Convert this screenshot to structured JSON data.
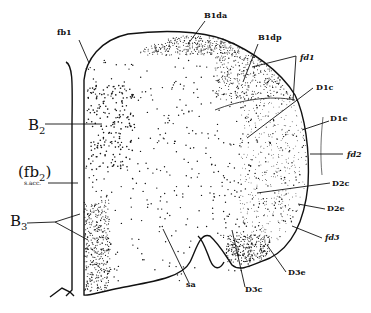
{
  "figure": {
    "type": "anatomical line drawing"
  },
  "labels": [
    {
      "id": "fb1",
      "text": "fb1",
      "x": 57,
      "y": 35,
      "style": "sm"
    },
    {
      "id": "B1da",
      "text": "B1da",
      "x": 204,
      "y": 18,
      "style": "sm"
    },
    {
      "id": "B1dp",
      "text": "B1dp",
      "x": 258,
      "y": 40,
      "style": "sm"
    },
    {
      "id": "fd1",
      "text": "fd1",
      "x": 300,
      "y": 60,
      "style": "sm-it"
    },
    {
      "id": "D1c",
      "text": "D1c",
      "x": 316,
      "y": 90,
      "style": "sm"
    },
    {
      "id": "D1e",
      "text": "D1e",
      "x": 330,
      "y": 121,
      "style": "sm"
    },
    {
      "id": "fd2",
      "text": "fd2",
      "x": 347,
      "y": 157,
      "style": "sm-it"
    },
    {
      "id": "B2",
      "text": "B2",
      "x": 28,
      "y": 130,
      "style": "big"
    },
    {
      "id": "fb2",
      "text": "(fb2)",
      "x": 18,
      "y": 177,
      "style": "big-paren"
    },
    {
      "id": "sacc",
      "text": "s.acc.",
      "x": 24,
      "y": 185,
      "style": "tiny"
    },
    {
      "id": "B3",
      "text": "B3",
      "x": 10,
      "y": 226,
      "style": "big"
    },
    {
      "id": "D2c",
      "text": "D2c",
      "x": 332,
      "y": 186,
      "style": "sm"
    },
    {
      "id": "D2e",
      "text": "D2e",
      "x": 327,
      "y": 211,
      "style": "sm"
    },
    {
      "id": "fd3",
      "text": "fd3",
      "x": 325,
      "y": 240,
      "style": "sm-it"
    },
    {
      "id": "D3e",
      "text": "D3e",
      "x": 288,
      "y": 275,
      "style": "sm"
    },
    {
      "id": "sa",
      "text": "sa",
      "x": 186,
      "y": 287,
      "style": "sm"
    },
    {
      "id": "D3c",
      "text": "D3c",
      "x": 245,
      "y": 292,
      "style": "sm"
    }
  ],
  "leaders": [
    {
      "for": "fb1",
      "points": [
        [
          79,
          40
        ],
        [
          89,
          63
        ]
      ]
    },
    {
      "for": "B1da",
      "points": [
        [
          205,
          21
        ],
        [
          188,
          44
        ]
      ]
    },
    {
      "for": "B1dp",
      "points": [
        [
          258,
          44
        ],
        [
          243,
          82
        ]
      ]
    },
    {
      "for": "fd1-a",
      "points": [
        [
          296,
          56
        ],
        [
          252,
          67
        ]
      ]
    },
    {
      "for": "fd1-b",
      "points": [
        [
          296,
          56
        ],
        [
          293,
          101
        ]
      ]
    },
    {
      "for": "D1c",
      "points": [
        [
          313,
          88
        ],
        [
          247,
          138
        ]
      ]
    },
    {
      "for": "D1e",
      "points": [
        [
          329,
          121
        ],
        [
          302,
          130
        ]
      ]
    },
    {
      "for": "fd2",
      "points": [
        [
          343,
          154
        ],
        [
          310,
          154
        ]
      ]
    },
    {
      "for": "B2",
      "points": [
        [
          45,
          124
        ],
        [
          102,
          124
        ]
      ]
    },
    {
      "for": "sacc",
      "points": [
        [
          48,
          183
        ],
        [
          78,
          183
        ]
      ]
    },
    {
      "for": "B3-a",
      "points": [
        [
          27,
          223
        ],
        [
          55,
          222
        ],
        [
          80,
          214
        ]
      ]
    },
    {
      "for": "B3-b",
      "points": [
        [
          55,
          222
        ],
        [
          88,
          240
        ]
      ]
    },
    {
      "for": "D2c",
      "points": [
        [
          330,
          183
        ],
        [
          257,
          193
        ]
      ]
    },
    {
      "for": "D2e",
      "points": [
        [
          325,
          209
        ],
        [
          298,
          204
        ]
      ]
    },
    {
      "for": "fd3",
      "points": [
        [
          322,
          238
        ],
        [
          292,
          226
        ]
      ]
    },
    {
      "for": "D3e",
      "points": [
        [
          286,
          272
        ],
        [
          267,
          245
        ]
      ]
    },
    {
      "for": "sa",
      "points": [
        [
          189,
          283
        ],
        [
          163,
          229
        ]
      ]
    },
    {
      "for": "D3c",
      "points": [
        [
          245,
          287
        ],
        [
          232,
          230
        ]
      ]
    }
  ],
  "colors": {
    "ink": "#111111",
    "background": "#ffffff"
  }
}
